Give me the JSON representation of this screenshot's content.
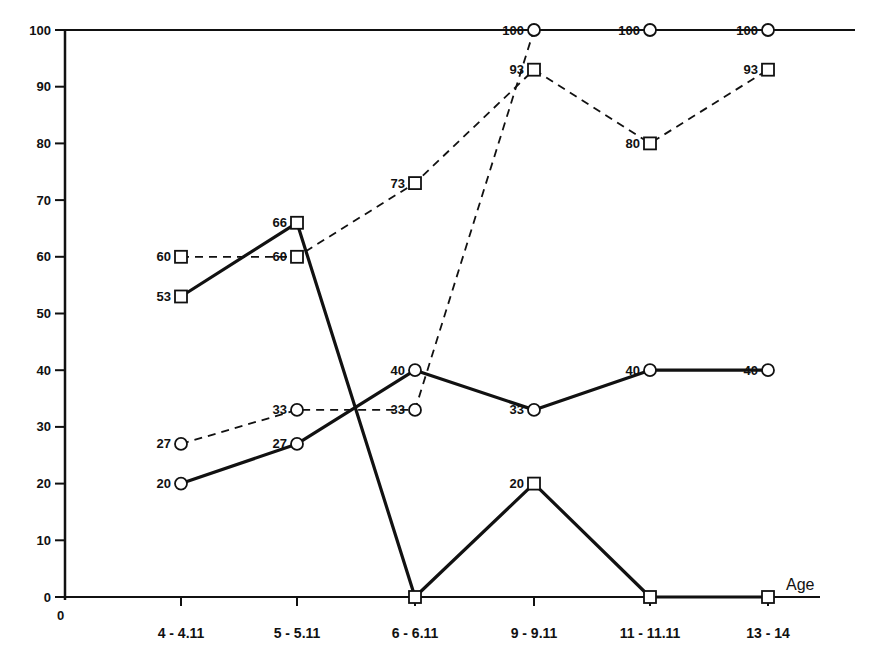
{
  "chart_data": {
    "type": "line",
    "title": "",
    "xlabel": "Age",
    "ylabel": "",
    "origin_label": "0",
    "ylim": [
      0,
      100
    ],
    "yticks": [
      0,
      10,
      20,
      30,
      40,
      50,
      60,
      70,
      80,
      90,
      100
    ],
    "grid": false,
    "legend": "none",
    "categories": [
      "4-4.11",
      "5-5.11",
      "6-6.11",
      "9-9.11",
      "11-11.11",
      "13-14"
    ],
    "series": [
      {
        "name": "solid-circle",
        "marker": "circle",
        "line": "solid",
        "values": [
          20,
          27,
          40,
          33,
          40,
          40
        ]
      },
      {
        "name": "dashed-circle",
        "marker": "circle",
        "line": "dashed",
        "values": [
          27,
          33,
          33,
          100,
          100,
          100
        ]
      },
      {
        "name": "solid-square",
        "marker": "square",
        "line": "solid",
        "values": [
          53,
          66,
          0,
          20,
          0,
          0
        ]
      },
      {
        "name": "dashed-square",
        "marker": "square",
        "line": "dashed",
        "values": [
          60,
          60,
          73,
          93,
          80,
          93
        ]
      }
    ]
  },
  "colors": {
    "ink": "#111111",
    "background": "#ffffff"
  }
}
